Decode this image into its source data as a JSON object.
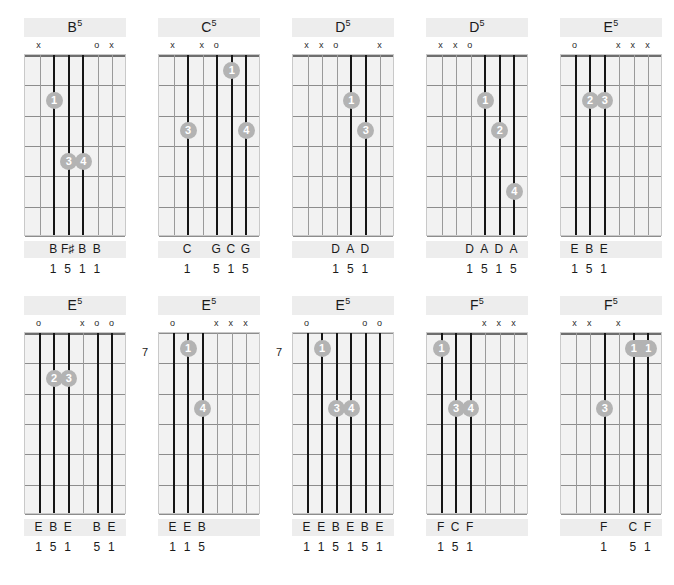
{
  "page": {
    "strings": 6,
    "frets": 6,
    "colors": {
      "band": "#ededed",
      "board": "#f2f2f2",
      "dot": "#b3b3b3",
      "played_string": "#161616",
      "fret_line": "#8d8d8d"
    },
    "marker_open": "o",
    "marker_mute": "x"
  },
  "rows": [
    {
      "chords": [
        {
          "name": "B",
          "superscript": "5",
          "start_fret": null,
          "fret_label": "",
          "markers": [
            "x",
            "",
            "",
            "",
            "o",
            "x"
          ],
          "played": [
            false,
            true,
            true,
            true,
            false,
            false
          ],
          "dots": [
            {
              "string": 2,
              "fret": 2,
              "finger": "1"
            },
            {
              "string": 3,
              "fret": 4,
              "finger": "3"
            },
            {
              "string": 4,
              "fret": 4,
              "finger": "4"
            }
          ],
          "barres": [],
          "notes": [
            "",
            "B",
            "F♯",
            "B",
            "B",
            ""
          ],
          "intervals": [
            "",
            "1",
            "5",
            "1",
            "1",
            ""
          ]
        },
        {
          "name": "C",
          "superscript": "5",
          "start_fret": null,
          "fret_label": "",
          "markers": [
            "x",
            "",
            "x",
            "o",
            "",
            ""
          ],
          "played": [
            false,
            true,
            false,
            true,
            true,
            true
          ],
          "dots": [
            {
              "string": 5,
              "fret": 1,
              "finger": "1"
            },
            {
              "string": 2,
              "fret": 3,
              "finger": "3"
            },
            {
              "string": 6,
              "fret": 3,
              "finger": "4"
            }
          ],
          "barres": [],
          "notes": [
            "",
            "C",
            "",
            "G",
            "C",
            "G"
          ],
          "intervals": [
            "",
            "1",
            "",
            "5",
            "1",
            "5"
          ]
        },
        {
          "name": "D",
          "superscript": "5",
          "start_fret": null,
          "fret_label": "",
          "markers": [
            "x",
            "x",
            "o",
            "",
            "",
            "x"
          ],
          "played": [
            false,
            false,
            false,
            true,
            true,
            false
          ],
          "dots": [
            {
              "string": 4,
              "fret": 2,
              "finger": "1"
            },
            {
              "string": 5,
              "fret": 3,
              "finger": "3"
            }
          ],
          "barres": [],
          "notes": [
            "",
            "",
            "D",
            "A",
            "D",
            ""
          ],
          "intervals": [
            "",
            "",
            "1",
            "5",
            "1",
            ""
          ]
        },
        {
          "name": "D",
          "superscript": "5",
          "start_fret": null,
          "fret_label": "",
          "markers": [
            "x",
            "x",
            "o",
            "",
            "",
            ""
          ],
          "played": [
            false,
            false,
            false,
            true,
            true,
            true
          ],
          "dots": [
            {
              "string": 4,
              "fret": 2,
              "finger": "1"
            },
            {
              "string": 5,
              "fret": 3,
              "finger": "2"
            },
            {
              "string": 6,
              "fret": 5,
              "finger": "4"
            }
          ],
          "barres": [],
          "notes": [
            "",
            "",
            "D",
            "A",
            "D",
            "A"
          ],
          "intervals": [
            "",
            "",
            "1",
            "5",
            "1",
            "5"
          ]
        },
        {
          "name": "E",
          "superscript": "5",
          "start_fret": null,
          "fret_label": "",
          "markers": [
            "o",
            "",
            "",
            "x",
            "x",
            "x"
          ],
          "played": [
            true,
            true,
            true,
            false,
            false,
            false
          ],
          "dots": [
            {
              "string": 2,
              "fret": 2,
              "finger": "2"
            },
            {
              "string": 3,
              "fret": 2,
              "finger": "3"
            }
          ],
          "barres": [],
          "notes": [
            "E",
            "B",
            "E",
            "",
            "",
            ""
          ],
          "intervals": [
            "1",
            "5",
            "1",
            "",
            "",
            ""
          ]
        }
      ]
    },
    {
      "chords": [
        {
          "name": "E",
          "superscript": "5",
          "start_fret": null,
          "fret_label": "",
          "markers": [
            "o",
            "",
            "",
            "x",
            "o",
            "o"
          ],
          "played": [
            true,
            true,
            true,
            false,
            true,
            true
          ],
          "dots": [
            {
              "string": 2,
              "fret": 2,
              "finger": "2"
            },
            {
              "string": 3,
              "fret": 2,
              "finger": "3"
            }
          ],
          "barres": [],
          "notes": [
            "E",
            "B",
            "E",
            "",
            "B",
            "E"
          ],
          "intervals": [
            "1",
            "5",
            "1",
            "",
            "5",
            "1"
          ]
        },
        {
          "name": "E",
          "superscript": "5",
          "start_fret": 7,
          "fret_label": "7",
          "markers": [
            "o",
            "",
            "",
            "x",
            "x",
            "x"
          ],
          "played": [
            true,
            true,
            true,
            false,
            false,
            false
          ],
          "dots": [
            {
              "string": 2,
              "fret": 1,
              "finger": "1"
            },
            {
              "string": 3,
              "fret": 3,
              "finger": "4"
            }
          ],
          "barres": [],
          "notes": [
            "E",
            "E",
            "B",
            "",
            "",
            ""
          ],
          "intervals": [
            "1",
            "1",
            "5",
            "",
            "",
            ""
          ]
        },
        {
          "name": "E",
          "superscript": "5",
          "start_fret": 7,
          "fret_label": "7",
          "markers": [
            "o",
            "",
            "",
            "",
            "o",
            "o"
          ],
          "played": [
            true,
            true,
            true,
            true,
            true,
            true
          ],
          "dots": [
            {
              "string": 2,
              "fret": 1,
              "finger": "1"
            },
            {
              "string": 3,
              "fret": 3,
              "finger": "3"
            },
            {
              "string": 4,
              "fret": 3,
              "finger": "4"
            }
          ],
          "barres": [],
          "notes": [
            "E",
            "E",
            "B",
            "E",
            "B",
            "E"
          ],
          "intervals": [
            "1",
            "1",
            "5",
            "1",
            "5",
            "1"
          ]
        },
        {
          "name": "F",
          "superscript": "5",
          "start_fret": null,
          "fret_label": "",
          "markers": [
            "",
            "",
            "",
            "x",
            "x",
            "x"
          ],
          "played": [
            true,
            true,
            true,
            false,
            false,
            false
          ],
          "dots": [
            {
              "string": 1,
              "fret": 1,
              "finger": "1"
            },
            {
              "string": 2,
              "fret": 3,
              "finger": "3"
            },
            {
              "string": 3,
              "fret": 3,
              "finger": "4"
            }
          ],
          "barres": [],
          "notes": [
            "F",
            "C",
            "F",
            "",
            "",
            ""
          ],
          "intervals": [
            "1",
            "5",
            "1",
            "",
            "",
            ""
          ]
        },
        {
          "name": "F",
          "superscript": "5",
          "start_fret": null,
          "fret_label": "",
          "markers": [
            "x",
            "x",
            "",
            "x",
            "",
            ""
          ],
          "played": [
            false,
            false,
            true,
            false,
            true,
            true
          ],
          "dots": [
            {
              "string": 5,
              "fret": 1,
              "finger": "1"
            },
            {
              "string": 6,
              "fret": 1,
              "finger": "1"
            },
            {
              "string": 3,
              "fret": 3,
              "finger": "3"
            }
          ],
          "barres": [
            {
              "fret": 1,
              "from_string": 5,
              "to_string": 6
            }
          ],
          "notes": [
            "",
            "",
            "F",
            "",
            "C",
            "F"
          ],
          "intervals": [
            "",
            "",
            "1",
            "",
            "5",
            "1"
          ]
        }
      ]
    }
  ]
}
